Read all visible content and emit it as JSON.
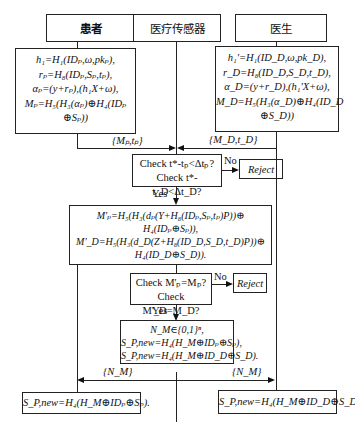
{
  "headers": {
    "patient": "患者",
    "sensor": "医疗传感器",
    "doctor": "医生"
  },
  "patient_box": {
    "lines": [
      "h₁=H₁(IDₚ,ω,pkₚ),",
      "rₚ=H₈(IDₚ,Sₚ,tₚ),",
      "αₚ=(y+rₚ),(h₁X+ω),",
      "Mₚ=H₅(H₃(αₚ)⊕H₄(IDₚ",
      "⊕Sₚ))"
    ]
  },
  "doctor_box": {
    "lines": [
      "h₁'=H₁(ID_D,ω,pk_D),",
      "r_D=H₈(ID_D,S_D,t_D),",
      "α_D=(y+r_D),(h₁'X+ω),",
      "M_D=H₅(H₃(α_D)⊕H₄(ID_D",
      "⊕S_D))"
    ]
  },
  "messages": {
    "patient_to_sensor": "{Mₚ,tₚ}",
    "doctor_to_sensor": "{M_D,t_D}",
    "sensor_to_patient": "{N_M}",
    "sensor_to_doctor": "{N_M}"
  },
  "check_time": {
    "lines": [
      "Check t*-tₚ<Δtₚ?",
      "Check t*-t_D<Δt_D?"
    ],
    "no_label": "No",
    "yes_label": "Yes",
    "reject": "Reject"
  },
  "compute_box": {
    "lines": [
      "M'ₚ=H₅(H₃(dₚ(Y+H₈(IDₚ,Sₚ,tₚ)P))⊕",
      "H₄(IDₚ⊕Sₚ)),",
      "M'_D=H₅(H₃(d_D(Z+H₈(ID_D,S_D,t_D)P))⊕",
      "H₄(ID_D⊕S_D))."
    ]
  },
  "check_m": {
    "lines": [
      "Check M'ₚ=Mₚ?",
      "Check M'_D=M_D?"
    ],
    "no_label": "No",
    "yes_label": "Yes",
    "reject": "Reject"
  },
  "update_box": {
    "lines": [
      "N_M∈{0,1}ⁿ,",
      "S_P,new=H₄(H_M⊕IDₚ⊕Sₚ),",
      "S_P,new=H₄(H_M⊕ID_D⊕S_D)."
    ]
  },
  "patient_result": "S_P,new=H₄(H_M⊕IDₚ⊕Sₚ).",
  "doctor_result": "S_P,new=H₄(H_M⊕ID_D⊕S_D)."
}
